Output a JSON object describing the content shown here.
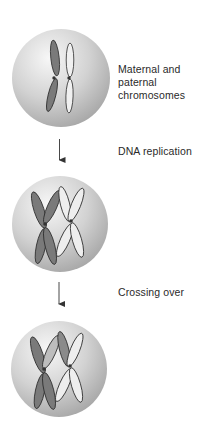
{
  "diagram": {
    "title": "",
    "steps": [
      {
        "id": "step-1",
        "label": "Maternal and paternal chromosomes",
        "cell": {
          "cx": 61,
          "cy": 78,
          "r": 49
        },
        "chromosomes": [
          "maternal (dark)",
          "paternal (light)"
        ],
        "state": "unreplicated homologs"
      },
      {
        "id": "step-2",
        "label": "DNA replication",
        "cell": {
          "cx": 60,
          "cy": 224,
          "r": 48
        },
        "chromosomes": [
          "maternal sister chromatids (dark)",
          "paternal sister chromatids (light)"
        ],
        "state": "replicated X-shaped chromosomes"
      },
      {
        "id": "step-3",
        "label": "Crossing over",
        "cell": {
          "cx": 59,
          "cy": 369,
          "r": 48
        },
        "chromosomes": [
          "maternal with exchanged segment",
          "paternal with exchanged segment"
        ],
        "state": "recombined chromatids"
      }
    ],
    "arrows": [
      {
        "from": "step-1",
        "to": "step-2"
      },
      {
        "from": "step-2",
        "to": "step-3"
      }
    ],
    "colors": {
      "maternal_fill": "#7a7a7a",
      "paternal_fill": "#eeeeee",
      "outline": "#2b2b2b",
      "cell_light": "#f4f4f4",
      "cell_dark": "#a9a9a9",
      "arrow": "#333333",
      "text": "#2a2a2a"
    }
  }
}
